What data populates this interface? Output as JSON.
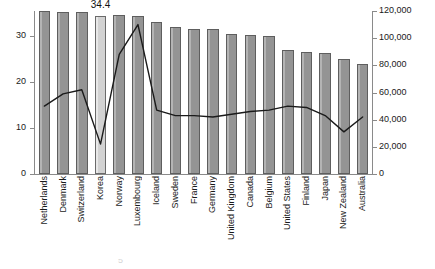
{
  "chart_data": {
    "type": "bar",
    "title": "",
    "subtitle": "",
    "xlabel": "",
    "ylabel": "",
    "categories": [
      "Netherlands",
      "Denmark",
      "Switzerland",
      "Korea",
      "Norway",
      "Luxembourg",
      "Iceland",
      "Sweden",
      "France",
      "Germany",
      "United Kingdom",
      "Canada",
      "Belgium",
      "United States",
      "Finland",
      "Japan",
      "New Zealand",
      "Australia"
    ],
    "series": [
      {
        "name": "bars",
        "axis": "left",
        "chart_type": "bar",
        "values": [
          35.4,
          35.3,
          35.2,
          34.4,
          34.6,
          34.5,
          33.0,
          32.0,
          31.6,
          31.5,
          30.6,
          30.2,
          30.0,
          27.1,
          26.6,
          26.4,
          25.0,
          24.0
        ],
        "highlight_index": 3,
        "highlight_label": "34.4"
      },
      {
        "name": "line",
        "axis": "right",
        "chart_type": "line",
        "values": [
          50000,
          59000,
          62000,
          22000,
          88000,
          110000,
          47000,
          43000,
          43000,
          42000,
          44000,
          46000,
          47000,
          50000,
          49000,
          43000,
          31000,
          42000
        ]
      }
    ],
    "left_axis": {
      "ticks": [
        "0",
        "10",
        "20",
        "30"
      ],
      "tick_values": [
        0,
        10,
        20,
        30
      ],
      "min": 0,
      "max": 35.5
    },
    "right_axis": {
      "ticks": [
        "0",
        "20,000",
        "40,000",
        "60,000",
        "80,000",
        "100,000",
        "120,000"
      ],
      "tick_values": [
        0,
        20000,
        40000,
        60000,
        80000,
        100000,
        120000
      ],
      "min": 0,
      "max": 120000
    },
    "grid": false,
    "legend": "none",
    "colors": {
      "bar_fill": "#9a9a9a",
      "bar_edge": "#5e5e5e",
      "highlight_fill": "#d8d8d8",
      "line": "#1a1a1a",
      "axis": "#8a8a8a",
      "text": "#1a1a1a",
      "background": "#ffffff"
    }
  },
  "footer": {
    "smudge": "5"
  }
}
